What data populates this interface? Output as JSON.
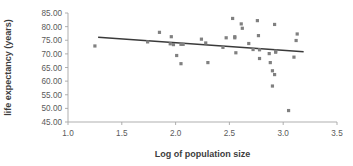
{
  "chart_data": {
    "type": "scatter",
    "title": "",
    "xlabel": "Log of population size",
    "ylabel": "life expectancy (years)",
    "xlim": [
      1.0,
      3.5
    ],
    "ylim": [
      45.0,
      85.0
    ],
    "xticks": [
      "1.0",
      "1.5",
      "2.0",
      "2.5",
      "3.0",
      "3.5"
    ],
    "xtick_values": [
      1.0,
      1.5,
      2.0,
      2.5,
      3.0,
      3.5
    ],
    "yticks": [
      "45.00",
      "50.00",
      "55.00",
      "60.00",
      "65.00",
      "70.00",
      "75.00",
      "80.00",
      "85.00"
    ],
    "ytick_values": [
      45.0,
      50.0,
      55.0,
      60.0,
      65.0,
      70.0,
      75.0,
      80.0,
      85.0
    ],
    "grid": false,
    "legend": false,
    "marker_color": "#808080",
    "trendline_color": "#3a3a3a",
    "axis_color": "#a6a6a6",
    "points": [
      {
        "x": 1.25,
        "y": 72.9
      },
      {
        "x": 1.74,
        "y": 74.4
      },
      {
        "x": 1.85,
        "y": 77.9
      },
      {
        "x": 1.96,
        "y": 76.3
      },
      {
        "x": 1.95,
        "y": 73.7
      },
      {
        "x": 1.98,
        "y": 73.4
      },
      {
        "x": 2.01,
        "y": 69.4
      },
      {
        "x": 2.05,
        "y": 73.5
      },
      {
        "x": 2.07,
        "y": 73.5
      },
      {
        "x": 2.05,
        "y": 66.4
      },
      {
        "x": 2.24,
        "y": 75.4
      },
      {
        "x": 2.28,
        "y": 74.0
      },
      {
        "x": 2.3,
        "y": 66.8
      },
      {
        "x": 2.44,
        "y": 72.4
      },
      {
        "x": 2.47,
        "y": 75.9
      },
      {
        "x": 2.53,
        "y": 83.0
      },
      {
        "x": 2.55,
        "y": 76.3
      },
      {
        "x": 2.55,
        "y": 75.9
      },
      {
        "x": 2.56,
        "y": 70.4
      },
      {
        "x": 2.61,
        "y": 81.0
      },
      {
        "x": 2.62,
        "y": 79.4
      },
      {
        "x": 2.68,
        "y": 73.8
      },
      {
        "x": 2.72,
        "y": 71.6
      },
      {
        "x": 2.76,
        "y": 82.2
      },
      {
        "x": 2.77,
        "y": 76.7
      },
      {
        "x": 2.78,
        "y": 71.5
      },
      {
        "x": 2.78,
        "y": 68.3
      },
      {
        "x": 2.87,
        "y": 70.1
      },
      {
        "x": 2.88,
        "y": 66.8
      },
      {
        "x": 2.9,
        "y": 63.8
      },
      {
        "x": 2.92,
        "y": 80.8
      },
      {
        "x": 2.93,
        "y": 71.0
      },
      {
        "x": 2.93,
        "y": 70.6
      },
      {
        "x": 2.92,
        "y": 62.4
      },
      {
        "x": 2.9,
        "y": 58.2
      },
      {
        "x": 3.05,
        "y": 49.2
      },
      {
        "x": 3.1,
        "y": 68.8
      },
      {
        "x": 3.12,
        "y": 74.9
      },
      {
        "x": 3.13,
        "y": 77.3
      }
    ],
    "trendline": {
      "x_start": 1.28,
      "y_start": 76.1,
      "x_end": 3.19,
      "y_end": 70.8
    }
  }
}
